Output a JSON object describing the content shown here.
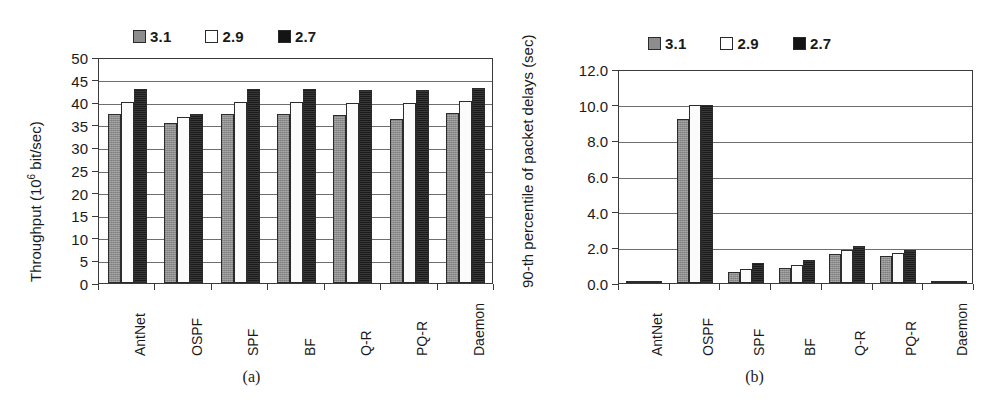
{
  "figure": {
    "panels": [
      {
        "caption": "(a)",
        "legend": [
          {
            "label": "3.1",
            "icon": "legend-swatch-gray",
            "color": "#8e8e8e"
          },
          {
            "label": "2.9",
            "icon": "legend-swatch-white",
            "color": "#ffffff"
          },
          {
            "label": "2.7",
            "icon": "legend-swatch-black",
            "color": "#1b1b1b"
          }
        ]
      },
      {
        "caption": "(b)",
        "legend": [
          {
            "label": "3.1",
            "icon": "legend-swatch-gray",
            "color": "#8e8e8e"
          },
          {
            "label": "2.9",
            "icon": "legend-swatch-white",
            "color": "#ffffff"
          },
          {
            "label": "2.7",
            "icon": "legend-swatch-black",
            "color": "#1b1b1b"
          }
        ]
      }
    ]
  },
  "chart_data": [
    {
      "id": "throughput",
      "type": "bar",
      "title": "",
      "xlabel": "",
      "ylabel": "Throughput (10^6 bit/sec)",
      "ylabel_base": "Throughput (10",
      "ylabel_exp": "6",
      "ylabel_tail": " bit/sec)",
      "categories": [
        "AntNet",
        "OSPF",
        "SPF",
        "BF",
        "Q-R",
        "PQ-R",
        "Daemon"
      ],
      "series": [
        {
          "name": "3.1",
          "color": "#8e8e8e",
          "values": [
            37.5,
            35.4,
            37.4,
            37.5,
            37.2,
            36.3,
            37.7
          ]
        },
        {
          "name": "2.9",
          "color": "#ffffff",
          "values": [
            40.1,
            36.8,
            40.0,
            40.0,
            39.8,
            39.9,
            40.2
          ]
        },
        {
          "name": "2.7",
          "color": "#1b1b1b",
          "values": [
            43.0,
            37.5,
            43.0,
            43.0,
            42.7,
            42.7,
            43.1
          ]
        }
      ],
      "ylim": [
        0,
        50
      ],
      "yticks": [
        0,
        5,
        10,
        15,
        20,
        25,
        30,
        35,
        40,
        45,
        50
      ],
      "ytick_labels": [
        "0",
        "5",
        "10",
        "15",
        "20",
        "25",
        "30",
        "35",
        "40",
        "45",
        "50"
      ],
      "grid": true,
      "legend_position": "top"
    },
    {
      "id": "packet-delay",
      "type": "bar",
      "title": "",
      "xlabel": "",
      "ylabel": "90-th percentile of packet delays (sec)",
      "categories": [
        "AntNet",
        "OSPF",
        "SPF",
        "BF",
        "Q-R",
        "PQ-R",
        "Daemon"
      ],
      "series": [
        {
          "name": "3.1",
          "color": "#8e8e8e",
          "values": [
            0.08,
            9.2,
            0.6,
            0.85,
            1.65,
            1.5,
            0.03
          ]
        },
        {
          "name": "2.9",
          "color": "#ffffff",
          "values": [
            0.08,
            10.0,
            0.8,
            1.0,
            1.85,
            1.7,
            0.03
          ]
        },
        {
          "name": "2.7",
          "color": "#1b1b1b",
          "values": [
            0.1,
            10.0,
            1.1,
            1.3,
            2.1,
            1.85,
            0.03
          ]
        }
      ],
      "ylim": [
        0,
        12
      ],
      "yticks": [
        0,
        2,
        4,
        6,
        8,
        10,
        12
      ],
      "ytick_labels": [
        "0.0",
        "2.0",
        "4.0",
        "6.0",
        "8.0",
        "10.0",
        "12.0"
      ],
      "grid": true,
      "legend_position": "top"
    }
  ]
}
